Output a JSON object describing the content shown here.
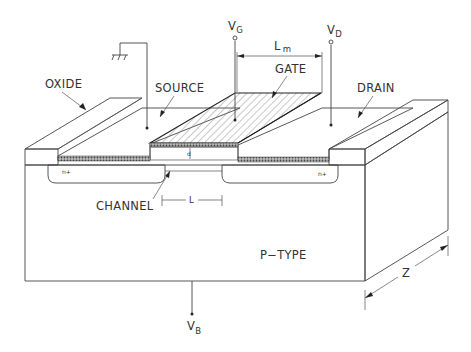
{
  "diagram": {
    "labels": {
      "oxide": "OXIDE",
      "source": "SOURCE",
      "gate": "GATE",
      "drain": "DRAIN",
      "channel": "CHANNEL",
      "substrate": "P−TYPE",
      "n_plus_left": "n+",
      "n_plus_right": "n+",
      "oxide_thickness": "d",
      "channel_length": "L",
      "metal_length": "L",
      "metal_length_sub": "m",
      "width": "Z"
    },
    "terminals": {
      "gate": {
        "v": "V",
        "sub": "G"
      },
      "drain": {
        "v": "V",
        "sub": "D"
      },
      "body": {
        "v": "V",
        "sub": "B"
      },
      "source": "ground-symbol"
    },
    "colors": {
      "line": "#444444",
      "hatch": "#777777",
      "text": "#333333",
      "background": "#ffffff"
    }
  }
}
